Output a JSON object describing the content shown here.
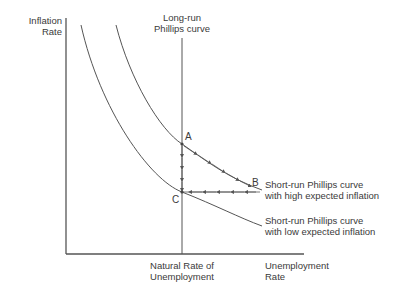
{
  "diagram": {
    "y_axis_label": [
      "Inflation",
      "Rate"
    ],
    "x_axis_label": [
      "Unemployment",
      "Rate"
    ],
    "natural_rate_label": [
      "Natural Rate of",
      "Unemployment"
    ],
    "long_run_label": [
      "Long-run",
      "Phillips curve"
    ],
    "high_curve_label": [
      "Short-run Phillips curve",
      "with high expected inflation"
    ],
    "low_curve_label": [
      "Short-run Phillips curve",
      "with low expected inflation"
    ],
    "points": {
      "A": "A",
      "B": "B",
      "C": "C"
    },
    "colors": {
      "line": "#555555",
      "text": "#3a3a3a",
      "background": "#ffffff"
    }
  }
}
